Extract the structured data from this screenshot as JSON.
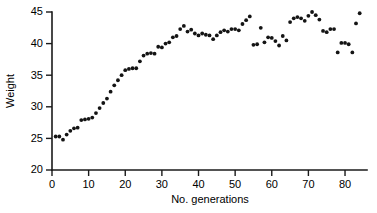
{
  "chart_data": {
    "type": "scatter",
    "title": "",
    "xlabel": "No. generations",
    "ylabel": "Weight",
    "xlim": [
      0,
      86
    ],
    "ylim": [
      20,
      45
    ],
    "xticks": [
      0,
      10,
      20,
      30,
      40,
      50,
      60,
      70,
      80
    ],
    "yticks": [
      20,
      25,
      30,
      35,
      40,
      45
    ],
    "grid": false,
    "legend": null,
    "series": [
      {
        "name": "Weight by generation",
        "marker": "filled-circle",
        "color": "#141414",
        "x": [
          1,
          2,
          3,
          4,
          5,
          6,
          7,
          8,
          9,
          10,
          11,
          12,
          13,
          14,
          15,
          16,
          17,
          18,
          19,
          20,
          21,
          22,
          23,
          24,
          25,
          26,
          27,
          28,
          29,
          30,
          31,
          32,
          33,
          34,
          35,
          36,
          37,
          38,
          39,
          40,
          41,
          42,
          43,
          44,
          45,
          46,
          47,
          48,
          49,
          50,
          51,
          52,
          53,
          54,
          55,
          56,
          57,
          58,
          59,
          60,
          61,
          62,
          63,
          64,
          65,
          66,
          67,
          68,
          69,
          70,
          71,
          72,
          73,
          74,
          75,
          76,
          77,
          78,
          79,
          80,
          81,
          82,
          83,
          84
        ],
        "y": [
          25.3,
          25.3,
          24.8,
          25.6,
          26.2,
          26.6,
          26.7,
          27.9,
          28.0,
          28.1,
          28.3,
          29.0,
          29.8,
          30.6,
          31.3,
          32.4,
          33.4,
          34.2,
          35.0,
          35.8,
          36.0,
          36.1,
          36.1,
          37.2,
          38.1,
          38.4,
          38.5,
          38.4,
          39.5,
          39.4,
          40.0,
          40.2,
          41.0,
          41.2,
          42.3,
          42.8,
          41.9,
          42.2,
          41.6,
          41.3,
          41.6,
          41.4,
          41.3,
          40.7,
          41.3,
          41.8,
          42.1,
          41.9,
          42.3,
          42.3,
          42.1,
          43.1,
          43.7,
          44.3,
          39.8,
          39.9,
          42.5,
          40.2,
          41.0,
          40.9,
          40.4,
          39.7,
          41.2,
          40.5,
          43.4,
          44.0,
          44.2,
          44.0,
          43.6,
          44.4,
          45.0,
          44.5,
          43.8,
          42.0,
          41.8,
          42.3,
          42.3,
          38.6,
          40.1,
          40.1,
          39.9,
          38.6,
          43.2,
          44.8
        ]
      }
    ]
  }
}
